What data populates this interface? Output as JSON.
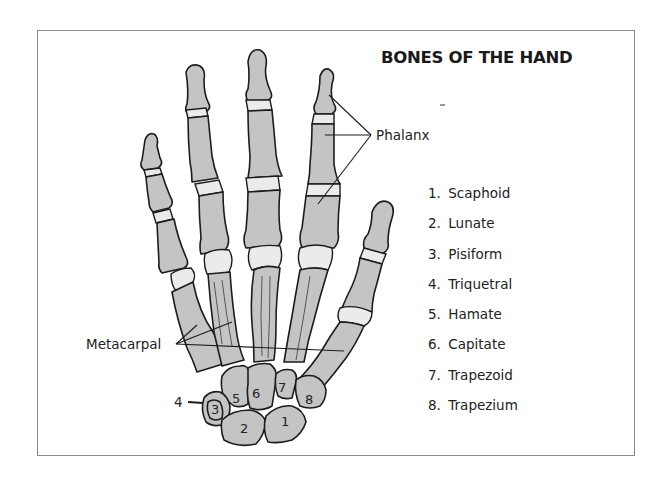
{
  "title": "BONES OF THE HAND",
  "labels": {
    "phalanx": "Phalanx",
    "metacarpal": "Metacarpal",
    "pointer_4": "4"
  },
  "carpal_numbers": [
    "1",
    "2",
    "3",
    "5",
    "6",
    "7",
    "8"
  ],
  "legend": [
    {
      "num": "1.",
      "name": "Scaphoid"
    },
    {
      "num": "2.",
      "name": "Lunate"
    },
    {
      "num": "3.",
      "name": "Pisiform"
    },
    {
      "num": "4.",
      "name": "Triquetral"
    },
    {
      "num": "5.",
      "name": "Hamate"
    },
    {
      "num": "6.",
      "name": "Capitate"
    },
    {
      "num": "7.",
      "name": "Trapezoid"
    },
    {
      "num": "8.",
      "name": "Trapezium"
    }
  ],
  "colors": {
    "bone": "#c4c4c4",
    "cartilage": "#ebebeb",
    "outline": "#1c1c1c",
    "frame": "#8a8a8a"
  }
}
